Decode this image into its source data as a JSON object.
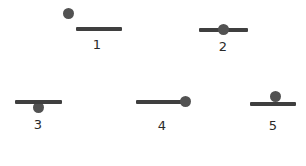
{
  "diagram": {
    "colors": {
      "bar": "#3f3f3f",
      "ball": "#525252",
      "label": "#2a2a2a",
      "background": "#ffffff"
    },
    "figures": [
      {
        "label": "1",
        "position": "ball above and to the left of bar, detached",
        "bar": {
          "x": 76,
          "y": 27,
          "width": 46
        },
        "ball": {
          "cx": 68,
          "cy": 13
        },
        "label_pos": {
          "x": 97,
          "y": 45
        }
      },
      {
        "label": "2",
        "position": "ball centered on bar",
        "bar": {
          "x": 199,
          "y": 28,
          "width": 49
        },
        "ball": {
          "cx": 223,
          "cy": 29
        },
        "label_pos": {
          "x": 223,
          "y": 47
        }
      },
      {
        "label": "3",
        "position": "ball hanging below center of bar",
        "bar": {
          "x": 15,
          "y": 100,
          "width": 47
        },
        "ball": {
          "cx": 38,
          "cy": 107
        },
        "label_pos": {
          "x": 38,
          "y": 125
        }
      },
      {
        "label": "4",
        "position": "ball at right end of bar",
        "bar": {
          "x": 136,
          "y": 100,
          "width": 48
        },
        "ball": {
          "cx": 185,
          "cy": 101
        },
        "label_pos": {
          "x": 162,
          "y": 126
        }
      },
      {
        "label": "5",
        "position": "ball resting on top center of bar",
        "bar": {
          "x": 250,
          "y": 102,
          "width": 46
        },
        "ball": {
          "cx": 275,
          "cy": 96
        },
        "label_pos": {
          "x": 273,
          "y": 126
        }
      }
    ]
  }
}
